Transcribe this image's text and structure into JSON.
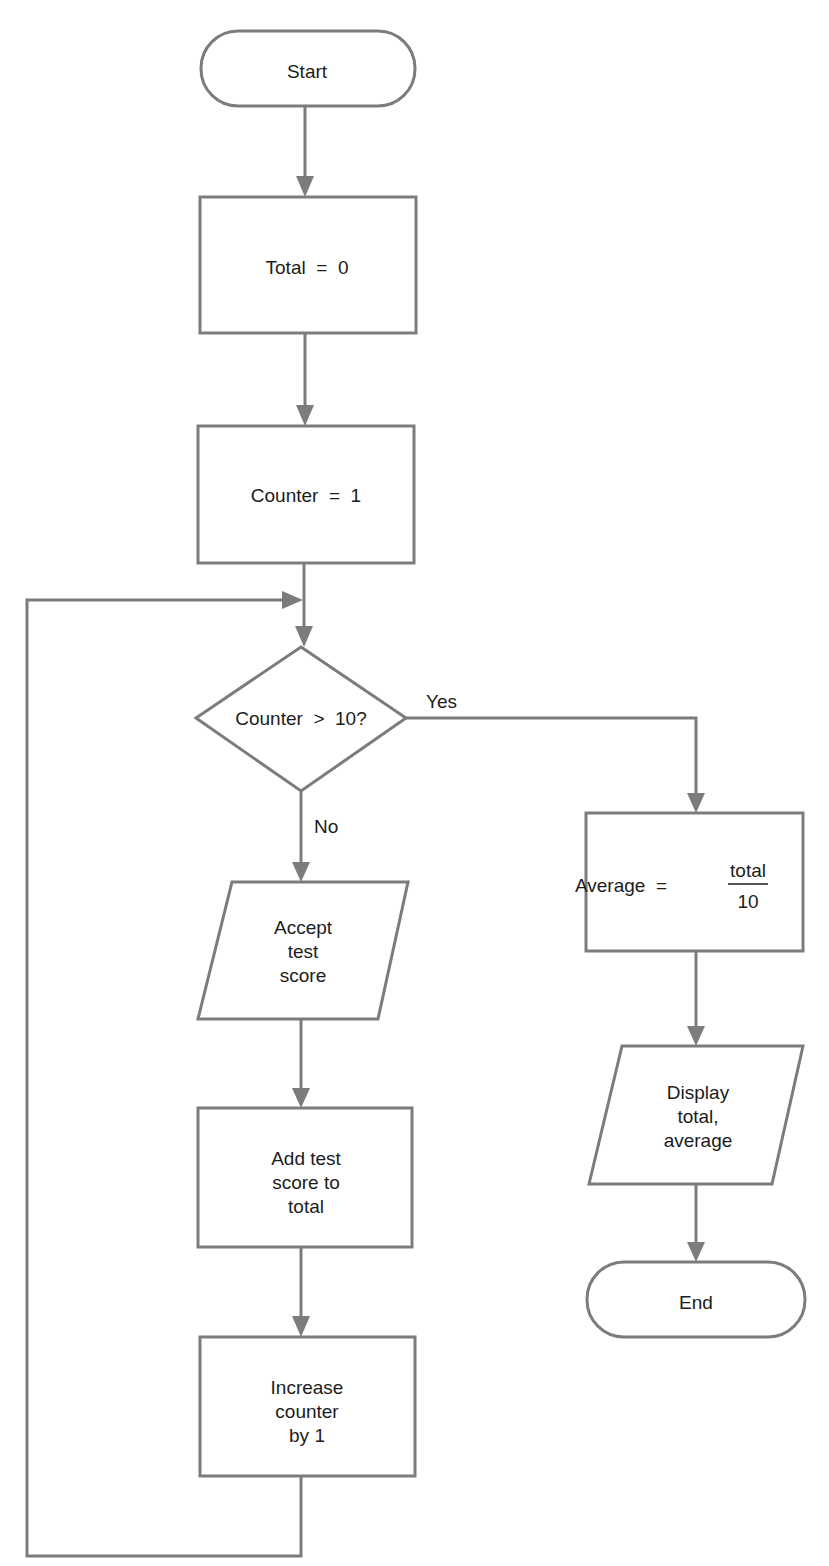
{
  "diagram": {
    "type": "flowchart",
    "nodes": {
      "start": {
        "shape": "terminator",
        "text": "Start"
      },
      "total_init": {
        "shape": "process",
        "text": "Total  =  0"
      },
      "counter_init": {
        "shape": "process",
        "text": "Counter  =  1"
      },
      "decision": {
        "shape": "decision",
        "text": "Counter  >  10?"
      },
      "accept": {
        "shape": "input-output",
        "lines": [
          "Accept",
          "test",
          "score"
        ]
      },
      "add": {
        "shape": "process",
        "lines": [
          "Add test",
          "score to",
          "total"
        ]
      },
      "increase": {
        "shape": "process",
        "lines": [
          "Increase",
          "counter",
          "by 1"
        ]
      },
      "average": {
        "shape": "process",
        "prefix": "Average  =",
        "numerator": "total",
        "denominator": "10"
      },
      "display": {
        "shape": "input-output",
        "lines": [
          "Display",
          "total,",
          "average"
        ]
      },
      "end": {
        "shape": "terminator",
        "text": "End"
      }
    },
    "edge_labels": {
      "yes": "Yes",
      "no": "No"
    },
    "edges": [
      {
        "from": "start",
        "to": "total_init"
      },
      {
        "from": "total_init",
        "to": "counter_init"
      },
      {
        "from": "counter_init",
        "to": "decision"
      },
      {
        "from": "decision",
        "to": "accept",
        "label": "No"
      },
      {
        "from": "accept",
        "to": "add"
      },
      {
        "from": "add",
        "to": "increase"
      },
      {
        "from": "increase",
        "to": "decision",
        "note": "loop back"
      },
      {
        "from": "decision",
        "to": "average",
        "label": "Yes"
      },
      {
        "from": "average",
        "to": "display"
      },
      {
        "from": "display",
        "to": "end"
      }
    ],
    "colors": {
      "stroke": "#7c7c7c",
      "text": "#1c1c1c",
      "background": "#ffffff"
    }
  }
}
